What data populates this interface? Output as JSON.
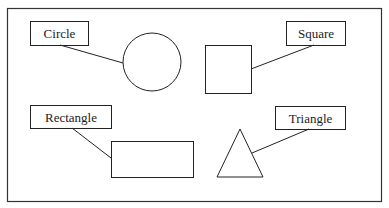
{
  "diagram": {
    "frame": {
      "x": 7,
      "y": 8,
      "w": 374,
      "h": 193
    },
    "stroke_color": "#222222",
    "shapes": [
      {
        "id": "circle",
        "label": "Circle",
        "kind": "circle",
        "cx": 152,
        "cy": 62,
        "r": 29,
        "label_box": {
          "x": 30,
          "y": 21,
          "w": 58,
          "h": 24
        },
        "connector": [
          60,
          45,
          123,
          63
        ]
      },
      {
        "id": "square",
        "label": "Square",
        "kind": "rect",
        "x": 205,
        "y": 45,
        "w": 46,
        "h": 48,
        "label_box": {
          "x": 286,
          "y": 21,
          "w": 59,
          "h": 24
        },
        "connector": [
          314,
          45,
          251,
          69
        ]
      },
      {
        "id": "rectangle",
        "label": "Rectangle",
        "kind": "rect",
        "x": 111,
        "y": 141,
        "w": 82,
        "h": 36,
        "label_box": {
          "x": 30,
          "y": 105,
          "w": 81,
          "h": 23
        },
        "connector": [
          72,
          128,
          111,
          158
        ]
      },
      {
        "id": "triangle",
        "label": "Triangle",
        "kind": "triangle",
        "points": "240,129 217,177 263,177",
        "label_box": {
          "x": 275,
          "y": 106,
          "w": 70,
          "h": 23
        },
        "connector": [
          309,
          129,
          252,
          153
        ]
      }
    ]
  }
}
